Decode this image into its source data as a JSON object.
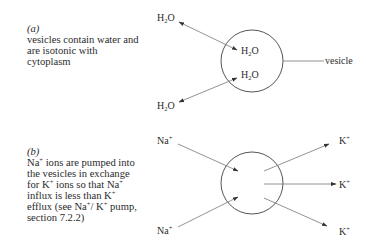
{
  "panel_a": {
    "tag": "(a)",
    "caption_lines": [
      "vesicles contain water and",
      "are isotonic with",
      "cytoplasm"
    ],
    "outer_label_top": {
      "base": "H",
      "sub": "2",
      "rest": "O"
    },
    "outer_label_bottom": {
      "base": "H",
      "sub": "2",
      "rest": "O"
    },
    "inner_label_top": {
      "base": "H",
      "sub": "2",
      "rest": "O"
    },
    "inner_label_bottom": {
      "base": "H",
      "sub": "2",
      "rest": "O"
    },
    "pointer_label": "vesicle"
  },
  "panel_b": {
    "tag": "(b)",
    "caption_lines": [
      {
        "pre": "Na",
        "sup": "+",
        "post": " ions are pumped into"
      },
      {
        "pre": "the vesicles in exchange",
        "sup": "",
        "post": ""
      },
      {
        "pre": "for K",
        "sup": "+",
        "post": " ions so that Na",
        "sup2": "+",
        "post2": ""
      },
      {
        "pre": "influx is less than K",
        "sup": "+",
        "post": ""
      },
      {
        "pre": "efflux (see Na",
        "sup": "+",
        "post": "/ K",
        "sup2": "+",
        "post2": " pump,"
      },
      {
        "pre": "section 7.2.2)",
        "sup": "",
        "post": ""
      }
    ],
    "na_label_top": {
      "base": "Na",
      "sup": "+"
    },
    "na_label_bottom": {
      "base": "Na",
      "sup": "+"
    },
    "k_label_top": {
      "base": "K",
      "sup": "+"
    },
    "k_label_middle": {
      "base": "K",
      "sup": "+"
    },
    "k_label_bottom": {
      "base": "K",
      "sup": "+"
    }
  },
  "colors": {
    "ink": "#2b2b2b",
    "line": "#555555",
    "background": "#ffffff"
  }
}
